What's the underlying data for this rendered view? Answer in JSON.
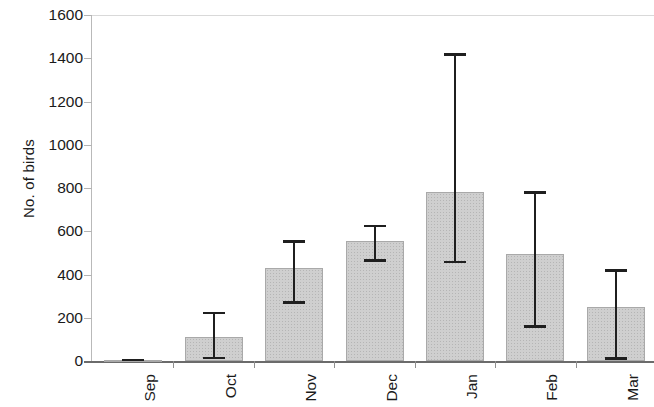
{
  "chart_data": {
    "type": "bar",
    "title": "",
    "xlabel": "",
    "ylabel": "No. of birds",
    "categories": [
      "Sep",
      "Oct",
      "Nov",
      "Dec",
      "Jan",
      "Feb",
      "Mar"
    ],
    "values": [
      5,
      111,
      430,
      555,
      781,
      495,
      250
    ],
    "error_upper": [
      10,
      227,
      559,
      629,
      1424,
      786,
      425
    ],
    "error_lower": [
      0,
      9,
      264,
      458,
      453,
      153,
      5
    ],
    "ylim": [
      0,
      1600
    ],
    "ytick_labels": [
      "0",
      "200",
      "400",
      "600",
      "800",
      "1000",
      "1200",
      "1400",
      "1600"
    ],
    "ytick_values": [
      0,
      200,
      400,
      600,
      800,
      1000,
      1200,
      1400,
      1600
    ],
    "grid": false,
    "legend": null,
    "bar_color": "#cfcfcf",
    "bar_border_color": "#a9a9a9",
    "error_color": "#1f1f1f",
    "axis_color": "#6b6b6b"
  }
}
